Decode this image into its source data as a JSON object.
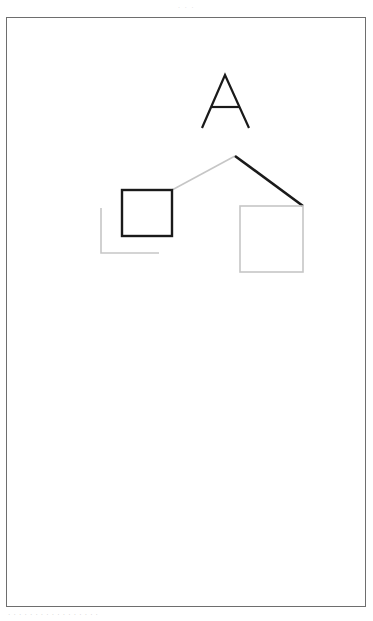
{
  "page": {
    "width": 373,
    "height": 621,
    "background": "#ffffff",
    "header_caption": "· · ·",
    "footer_caption": "· · · · ·   · · · · · ·   · · · · · ·"
  },
  "frame": {
    "name": "page-border",
    "x": 6,
    "y": 17,
    "width": 360,
    "height": 590,
    "stroke": "#6e6e6e",
    "stroke_width": 1,
    "fill": "#ffffff"
  },
  "colors": {
    "ink_black": "#1a1a1a",
    "ghost_gray": "#c6c6c6",
    "frame_gray": "#6e6e6e",
    "paper_white": "#ffffff"
  },
  "chart_data": {
    "type": "line-drawing",
    "title": "",
    "coordinate_space": {
      "width": 373,
      "height": 621,
      "origin": "top-left"
    },
    "shapes": [
      {
        "id": "letter-a",
        "label": "A",
        "kind": "glyph",
        "style": "ink",
        "stroke": "#1a1a1a",
        "stroke_width": 2.2,
        "points": [
          [
            202,
            128
          ],
          [
            225,
            75
          ],
          [
            249,
            128
          ]
        ],
        "crossbar": [
          [
            211,
            107
          ],
          [
            240,
            107
          ]
        ]
      },
      {
        "id": "roof-left",
        "label": "left roof slope",
        "kind": "line",
        "style": "ghost",
        "stroke": "#c6c6c6",
        "stroke_width": 1.6,
        "points": [
          [
            172,
            190
          ],
          [
            235,
            156
          ]
        ]
      },
      {
        "id": "roof-right",
        "label": "right roof slope",
        "kind": "line",
        "style": "ink",
        "stroke": "#1a1a1a",
        "stroke_width": 2.6,
        "points": [
          [
            235,
            156
          ],
          [
            303,
            206
          ]
        ]
      },
      {
        "id": "square-left-ink",
        "label": "left square (traced)",
        "kind": "rect",
        "style": "ink",
        "stroke": "#1a1a1a",
        "stroke_width": 2.4,
        "x": 122,
        "y": 190,
        "width": 50,
        "height": 46
      },
      {
        "id": "square-left-ghost",
        "label": "left square template corner",
        "kind": "polyline",
        "style": "ghost",
        "stroke": "#c6c6c6",
        "stroke_width": 1.6,
        "points": [
          [
            101,
            208
          ],
          [
            101,
            253
          ],
          [
            159,
            253
          ]
        ]
      },
      {
        "id": "square-right-ghost",
        "label": "right square (untraced)",
        "kind": "rect",
        "style": "ghost",
        "stroke": "#c6c6c6",
        "stroke_width": 1.6,
        "x": 240,
        "y": 206,
        "width": 63,
        "height": 66
      }
    ],
    "legend": [
      {
        "name": "traced stroke",
        "color": "#1a1a1a"
      },
      {
        "name": "template stroke",
        "color": "#c6c6c6"
      }
    ]
  }
}
